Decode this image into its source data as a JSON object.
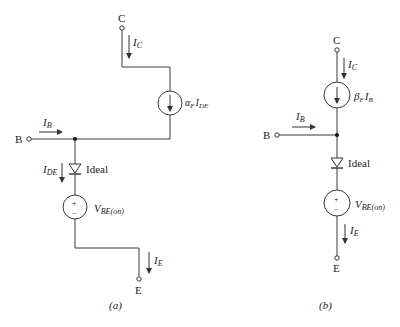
{
  "figure_a": {
    "caption": "(a)",
    "terminals": {
      "collector": "C",
      "base": "B",
      "emitter": "E"
    },
    "currents": {
      "ic": {
        "main": "I",
        "sub": "C"
      },
      "ib": {
        "main": "I",
        "sub": "B"
      },
      "ide": {
        "main": "I",
        "sub": "DE"
      },
      "ie": {
        "main": "I",
        "sub": "E"
      }
    },
    "current_source": {
      "coef": "α",
      "coef_sub": "F",
      "main": "I",
      "sub": "DE"
    },
    "diode_label": "Ideal",
    "voltage_source": {
      "main": "V",
      "sub": "BE(on)",
      "plus": "+",
      "minus": "−"
    }
  },
  "figure_b": {
    "caption": "(b)",
    "terminals": {
      "collector": "C",
      "base": "B",
      "emitter": "E"
    },
    "currents": {
      "ic": {
        "main": "I",
        "sub": "C"
      },
      "ib": {
        "main": "I",
        "sub": "B"
      },
      "ie": {
        "main": "I",
        "sub": "E"
      }
    },
    "current_source": {
      "coef": "β",
      "coef_sub": "F",
      "main": "I",
      "sub": "B"
    },
    "diode_label": "Ideal",
    "voltage_source": {
      "main": "V",
      "sub": "BE(on)",
      "plus": "+",
      "minus": "−"
    }
  }
}
